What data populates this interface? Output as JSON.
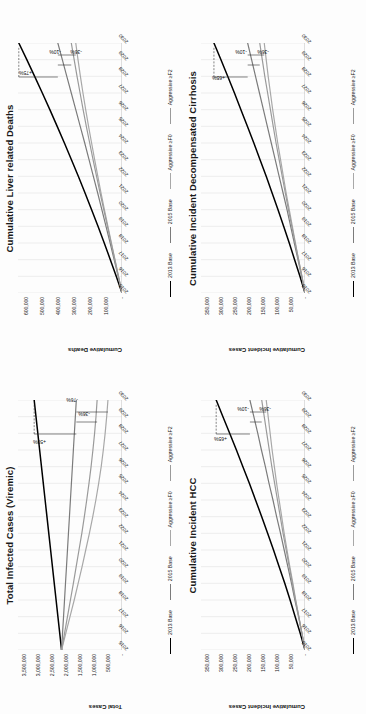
{
  "page": {
    "background_color": "#fdfdfd",
    "layout": "2x2 grid of line charts, each rotated 90 degrees counter-clockwise",
    "rotation_degrees": -90
  },
  "legend": {
    "items": [
      {
        "label": "2013 Base",
        "color": "#000000"
      },
      {
        "label": "2015 Base",
        "color": "#7b7b7b"
      },
      {
        "label": "Aggressive ≥F0",
        "color": "#a8a8a8"
      },
      {
        "label": "Aggressive ≥F2",
        "color": "#9a9a9a"
      }
    ]
  },
  "chart_data": [
    {
      "type": "line",
      "title": "Cumulative Liver related Deaths",
      "xlabel": "",
      "ylabel": "Cumulative Deaths",
      "x": [
        2015,
        2016,
        2017,
        2018,
        2019,
        2020,
        2021,
        2022,
        2023,
        2024,
        2025,
        2026,
        2027,
        2028,
        2029,
        2030
      ],
      "xticklabels": [
        "2015",
        "2016",
        "2017",
        "2018",
        "2019",
        "2020",
        "2021",
        "2022",
        "2023",
        "2024",
        "2025",
        "2026",
        "2027",
        "2028",
        "2029",
        "2030"
      ],
      "yticklabels": [
        "-",
        "100,000",
        "200,000",
        "300,000",
        "400,000",
        "500,000",
        "600,000"
      ],
      "yticks": [
        0,
        100000,
        200000,
        300000,
        400000,
        500000,
        600000
      ],
      "ylim": [
        0,
        650000
      ],
      "grid": true,
      "legend_position": "bottom",
      "series": [
        {
          "name": "2013 Base",
          "color": "#000000",
          "width": 1.5,
          "values": [
            0,
            36000,
            73000,
            111000,
            150000,
            190000,
            231000,
            273000,
            316000,
            360000,
            405000,
            451000,
            498000,
            546000,
            595000,
            645000
          ]
        },
        {
          "name": "2015 Base",
          "color": "#7b7b7b",
          "width": 1.2,
          "values": [
            0,
            24000,
            49000,
            74000,
            100000,
            126000,
            152000,
            179000,
            206000,
            233000,
            261000,
            289000,
            317000,
            345000,
            373000,
            401000
          ]
        },
        {
          "name": "Aggressive ≥F0",
          "color": "#a8a8a8",
          "width": 1.2,
          "values": [
            0,
            22000,
            44000,
            66000,
            88000,
            110000,
            131000,
            151000,
            171000,
            190000,
            209000,
            227000,
            244000,
            260000,
            275000,
            289000
          ]
        },
        {
          "name": "Aggressive ≥F2",
          "color": "#9a9a9a",
          "width": 1.2,
          "values": [
            0,
            22000,
            45000,
            68000,
            91000,
            114000,
            137000,
            159000,
            181000,
            202000,
            223000,
            243000,
            262000,
            281000,
            299000,
            317000
          ]
        }
      ],
      "annotations": [
        {
          "text": "+75%",
          "x": 2028.0,
          "y": 560000
        },
        {
          "text": "-10%",
          "x": 2029.3,
          "y": 380000
        },
        {
          "text": "-36%",
          "x": 2029.3,
          "y": 248000
        }
      ]
    },
    {
      "type": "line",
      "title": "Cumulative Incident Decompensated Cirrhosis",
      "xlabel": "",
      "ylabel": "Cumulative Incident Cases",
      "x": [
        2015,
        2016,
        2017,
        2018,
        2019,
        2020,
        2021,
        2022,
        2023,
        2024,
        2025,
        2026,
        2027,
        2028,
        2029,
        2030
      ],
      "xticklabels": [
        "2015",
        "2016",
        "2017",
        "2018",
        "2019",
        "2020",
        "2021",
        "2022",
        "2023",
        "2024",
        "2025",
        "2026",
        "2027",
        "2028",
        "2029",
        "2030"
      ],
      "yticklabels": [
        "-",
        "50,000",
        "100,000",
        "150,000",
        "200,000",
        "250,000",
        "300,000",
        "350,000"
      ],
      "yticks": [
        0,
        50000,
        100000,
        150000,
        200000,
        250000,
        300000,
        350000
      ],
      "ylim": [
        0,
        370000
      ],
      "grid": true,
      "legend_position": "bottom",
      "series": [
        {
          "name": "2013 Base",
          "color": "#000000",
          "width": 1.5,
          "values": [
            0,
            18000,
            37000,
            56000,
            76000,
            96000,
            117000,
            138000,
            160000,
            182000,
            205000,
            228000,
            251000,
            275000,
            299000,
            324000
          ]
        },
        {
          "name": "2015 Base",
          "color": "#7b7b7b",
          "width": 1.2,
          "values": [
            0,
            12000,
            25000,
            38000,
            51000,
            64000,
            78000,
            92000,
            106000,
            120000,
            134000,
            148000,
            162000,
            176000,
            190000,
            204000
          ]
        },
        {
          "name": "Aggressive ≥F0",
          "color": "#a8a8a8",
          "width": 1.2,
          "values": [
            0,
            11000,
            23000,
            34000,
            45000,
            56000,
            67000,
            77000,
            87000,
            97000,
            106000,
            115000,
            123000,
            131000,
            138000,
            145000
          ]
        },
        {
          "name": "Aggressive ≥F2",
          "color": "#9a9a9a",
          "width": 1.2,
          "values": [
            0,
            11000,
            23000,
            35000,
            47000,
            59000,
            70000,
            81000,
            92000,
            103000,
            113000,
            123000,
            133000,
            143000,
            152000,
            161000
          ]
        }
      ],
      "annotations": [
        {
          "text": "+65%",
          "x": 2027.7,
          "y": 285000
        },
        {
          "text": "-10%",
          "x": 2029.3,
          "y": 205000
        },
        {
          "text": "-36%",
          "x": 2029.3,
          "y": 128000
        }
      ]
    },
    {
      "type": "line",
      "title": "Total Infected Cases (Viremic)",
      "xlabel": "",
      "ylabel": "Total Cases",
      "x": [
        2015,
        2016,
        2017,
        2018,
        2019,
        2020,
        2021,
        2022,
        2023,
        2024,
        2025,
        2026,
        2027,
        2028,
        2029,
        2030
      ],
      "xticklabels": [
        "2015",
        "2016",
        "2017",
        "2018",
        "2019",
        "2020",
        "2021",
        "2022",
        "2023",
        "2024",
        "2025",
        "2026",
        "2027",
        "2028",
        "2029",
        "2030"
      ],
      "yticklabels": [
        "-",
        "500,000",
        "1,000,000",
        "1,500,000",
        "2,000,000",
        "2,500,000",
        "3,000,000",
        "3,500,000"
      ],
      "yticks": [
        0,
        500000,
        1000000,
        1500000,
        2000000,
        2500000,
        3000000,
        3500000
      ],
      "ylim": [
        0,
        3700000
      ],
      "grid": true,
      "legend_position": "bottom",
      "series": [
        {
          "name": "2013 Base",
          "color": "#000000",
          "width": 1.5,
          "values": [
            2150000,
            2215000,
            2280000,
            2345000,
            2410000,
            2475000,
            2540000,
            2605000,
            2670000,
            2735000,
            2800000,
            2865000,
            2930000,
            2995000,
            3060000,
            3125000
          ]
        },
        {
          "name": "2015 Base",
          "color": "#7b7b7b",
          "width": 1.2,
          "values": [
            2150000,
            2115000,
            2080000,
            2045000,
            2010000,
            1975000,
            1940000,
            1905000,
            1870000,
            1835000,
            1800000,
            1765000,
            1730000,
            1695000,
            1660000,
            1625000
          ]
        },
        {
          "name": "Aggressive ≥F0",
          "color": "#a8a8a8",
          "width": 1.2,
          "values": [
            2150000,
            2000000,
            1850000,
            1700000,
            1560000,
            1420000,
            1290000,
            1160000,
            1040000,
            930000,
            830000,
            740000,
            665000,
            600000,
            545000,
            500000
          ]
        },
        {
          "name": "Aggressive ≥F2",
          "color": "#9a9a9a",
          "width": 1.2,
          "values": [
            2150000,
            2045000,
            1940000,
            1835000,
            1730000,
            1630000,
            1530000,
            1430000,
            1340000,
            1255000,
            1175000,
            1100000,
            1035000,
            975000,
            925000,
            885000
          ]
        }
      ],
      "annotations": [
        {
          "text": "+50%",
          "x": 2027.3,
          "y": 2720000
        },
        {
          "text": "-76%",
          "x": 2029.8,
          "y": 1560000
        },
        {
          "text": "-36%",
          "x": 2029.0,
          "y": 1130000
        }
      ]
    },
    {
      "type": "line",
      "title": "Cumulative Incident HCC",
      "xlabel": "",
      "ylabel": "Cumulative Incident Cases",
      "x": [
        2015,
        2016,
        2017,
        2018,
        2019,
        2020,
        2021,
        2022,
        2023,
        2024,
        2025,
        2026,
        2027,
        2028,
        2029,
        2030
      ],
      "xticklabels": [
        "2015",
        "2016",
        "2017",
        "2018",
        "2019",
        "2020",
        "2021",
        "2022",
        "2023",
        "2024",
        "2025",
        "2026",
        "2027",
        "2028",
        "2029",
        "2030"
      ],
      "yticklabels": [
        "-",
        "50,000",
        "100,000",
        "150,000",
        "200,000",
        "250,000",
        "300,000",
        "350,000"
      ],
      "yticks": [
        0,
        50000,
        100000,
        150000,
        200000,
        250000,
        300000,
        350000
      ],
      "ylim": [
        0,
        370000
      ],
      "grid": true,
      "legend_position": "bottom",
      "series": [
        {
          "name": "2013 Base",
          "color": "#000000",
          "width": 1.5,
          "values": [
            0,
            17000,
            35000,
            53000,
            72000,
            92000,
            112000,
            133000,
            154000,
            176000,
            198000,
            221000,
            244000,
            268000,
            292000,
            316000
          ]
        },
        {
          "name": "2015 Base",
          "color": "#7b7b7b",
          "width": 1.2,
          "values": [
            0,
            11000,
            23000,
            36000,
            48000,
            61000,
            74000,
            87000,
            101000,
            114000,
            128000,
            141000,
            155000,
            168000,
            182000,
            196000
          ]
        },
        {
          "name": "Aggressive ≥F0",
          "color": "#a8a8a8",
          "width": 1.2,
          "values": [
            0,
            11000,
            22000,
            33000,
            43000,
            54000,
            64000,
            74000,
            83000,
            92000,
            101000,
            109000,
            117000,
            124000,
            131000,
            138000
          ]
        },
        {
          "name": "Aggressive ≥F2",
          "color": "#9a9a9a",
          "width": 1.2,
          "values": [
            0,
            11000,
            22000,
            34000,
            45000,
            56000,
            67000,
            78000,
            88000,
            98000,
            108000,
            118000,
            127000,
            136000,
            145000,
            154000
          ]
        }
      ],
      "annotations": [
        {
          "text": "+65%",
          "x": 2027.5,
          "y": 278000
        },
        {
          "text": "-10%",
          "x": 2029.3,
          "y": 198000
        },
        {
          "text": "-36%",
          "x": 2029.3,
          "y": 122000
        }
      ]
    }
  ]
}
